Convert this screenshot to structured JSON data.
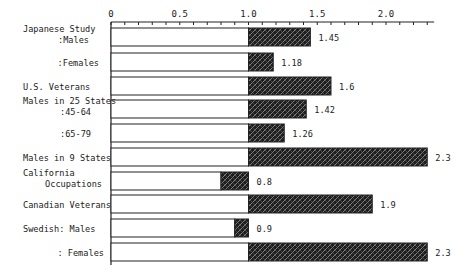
{
  "chart_data": {
    "type": "bar",
    "orientation": "horizontal",
    "title": "",
    "xlabel": "",
    "ylabel": "",
    "baseline": 1.0,
    "xlim": [
      0,
      2.35
    ],
    "x_ticks": [
      {
        "value": 0,
        "label": "0"
      },
      {
        "value": 0.5,
        "label": "0.5"
      },
      {
        "value": 1.0,
        "label": "1.0"
      },
      {
        "value": 1.5,
        "label": "1.5"
      },
      {
        "value": 2.0,
        "label": "2.0"
      }
    ],
    "minor_tick_step": 0.1,
    "grid": false,
    "legend": null,
    "categories": [
      {
        "lines": [
          "Japanese Study",
          ":Males"
        ],
        "value": 1.45,
        "label": "1.45"
      },
      {
        "lines": [
          ":Females"
        ],
        "value": 1.18,
        "label": "1.18"
      },
      {
        "lines": [
          "U.S. Veterans"
        ],
        "value": 1.6,
        "label": "1.6"
      },
      {
        "lines": [
          "Males in 25 States",
          ":45-64"
        ],
        "value": 1.42,
        "label": "1.42"
      },
      {
        "lines": [
          ":65-79"
        ],
        "value": 1.26,
        "label": "1.26"
      },
      {
        "lines": [
          "Males in 9 States"
        ],
        "value": 2.3,
        "label": "2.3"
      },
      {
        "lines": [
          "California",
          "Occupations"
        ],
        "value": 0.8,
        "label": "0.8"
      },
      {
        "lines": [
          "Canadian Veterans"
        ],
        "value": 1.9,
        "label": "1.9"
      },
      {
        "lines": [
          "Swedish: Males"
        ],
        "value": 0.9,
        "label": "0.9"
      },
      {
        "lines": [
          ": Females"
        ],
        "value": 2.3,
        "label": "2.3"
      }
    ],
    "values": [
      1.45,
      1.18,
      1.6,
      1.42,
      1.26,
      2.3,
      0.8,
      1.9,
      0.9,
      2.3
    ],
    "colors": {
      "bar_fill": "#1e1e1e",
      "hatch": "#9a9a9a",
      "outline": "#222222",
      "background": "#ffffff"
    }
  }
}
